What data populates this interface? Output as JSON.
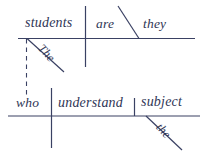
{
  "diagram": {
    "type": "reed-kellogg-sentence-diagram",
    "title": "",
    "ink_color": "#3a4163",
    "text_color": "#2f3656",
    "background_color": "#ffffff",
    "clauses": {
      "main": {
        "subject": "students",
        "verb": "are",
        "predicate_nominative": "they",
        "subject_modifier": "The"
      },
      "relative": {
        "subject": "who",
        "verb": "understand",
        "direct_object": "subject",
        "object_modifier": "the"
      }
    },
    "labels": {
      "students": "students",
      "are": "are",
      "they": "they",
      "the_top": "The",
      "who": "who",
      "understand": "understand",
      "subject": "subject",
      "the_bottom": "the"
    },
    "connector": {
      "style": "dashed",
      "meaning": "relative-pronoun-reference"
    }
  }
}
